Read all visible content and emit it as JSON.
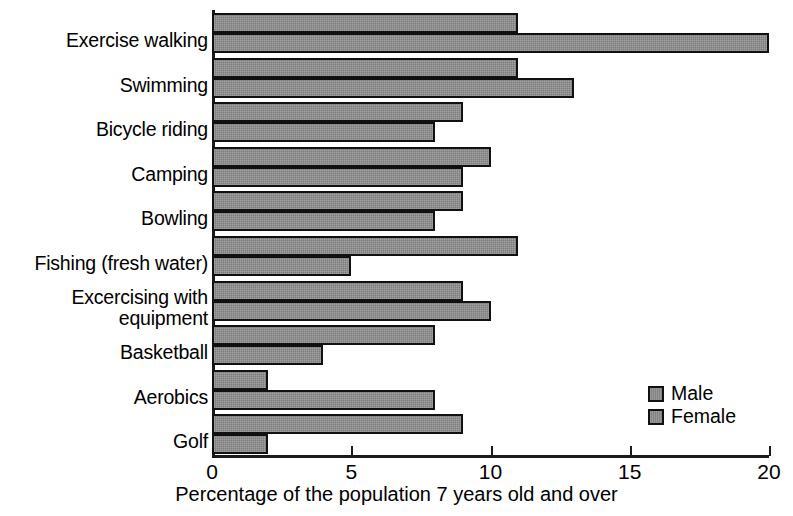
{
  "chart_data": {
    "type": "bar",
    "orientation": "horizontal",
    "title": "",
    "xlabel": "Percentage of the population 7 years old and over",
    "ylabel": "",
    "xlim": [
      0,
      20
    ],
    "xticks": [
      0,
      5,
      10,
      15,
      20
    ],
    "xtick_labels": [
      "0",
      "5",
      "10",
      "15",
      "20"
    ],
    "grid": false,
    "legend_position": "bottom-right",
    "categories": [
      "Exercise walking",
      "Swimming",
      "Bicycle riding",
      "Camping",
      "Bowling",
      "Fishing (fresh water)",
      "Excercising with\nequipment",
      "Basketball",
      "Aerobics",
      "Golf"
    ],
    "series": [
      {
        "name": "Male",
        "color": "#8c8c8c",
        "values": [
          11,
          11,
          9,
          10,
          9,
          11,
          9,
          8,
          2,
          9
        ]
      },
      {
        "name": "Female",
        "color": "#8c8c8c",
        "values": [
          20,
          13,
          8,
          9,
          8,
          5,
          10,
          4,
          8,
          2
        ]
      }
    ]
  },
  "legend": {
    "items": [
      {
        "label": "Male"
      },
      {
        "label": "Female"
      }
    ]
  },
  "colors": {
    "bar_fill": "#8c8c8c",
    "bar_stroke": "#111111",
    "axis": "#1a1a1a",
    "text": "#000000",
    "background": "#ffffff"
  }
}
